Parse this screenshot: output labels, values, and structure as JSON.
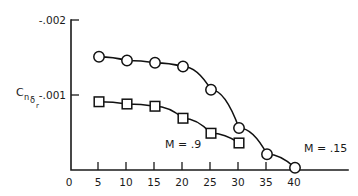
{
  "chart_data": {
    "type": "line",
    "title": "",
    "subtitle": "",
    "xlabel": "",
    "ylabel": "Cnδr",
    "ylabel_base": "C",
    "ylabel_sub1": "n",
    "ylabel_sub2": "δ",
    "ylabel_sub3": "r",
    "x": [
      5,
      10,
      15,
      20,
      25,
      30,
      35,
      40
    ],
    "xlim": [
      0,
      42
    ],
    "ylim": [
      0,
      -0.002
    ],
    "grid": false,
    "legend_position": "inline-annotations",
    "xticks": [
      0,
      5,
      10,
      15,
      20,
      25,
      30,
      35,
      40
    ],
    "xticklabels": [
      "0",
      "5",
      "10",
      "15",
      "20",
      "25",
      "30",
      "35",
      "40"
    ],
    "yticks": [
      0,
      -0.001,
      -0.002
    ],
    "yticklabels": [
      "0",
      "-.001",
      "-.002"
    ],
    "series": [
      {
        "name": "M = .15",
        "marker": "circle",
        "x": [
          5,
          10,
          15,
          20,
          25,
          30,
          35,
          40
        ],
        "values": [
          -0.00151,
          -0.00146,
          -0.00143,
          -0.00138,
          -0.00107,
          -0.00056,
          -0.00021,
          -3e-05
        ]
      },
      {
        "name": "M = .9",
        "marker": "square",
        "x": [
          5,
          10,
          15,
          20,
          25,
          30
        ],
        "values": [
          -0.00091,
          -0.00088,
          -0.00085,
          -0.00069,
          -0.00049,
          -0.00036
        ]
      }
    ],
    "annotations": [
      {
        "text": "M = .9",
        "x": 22.0,
        "y": -0.00042
      },
      {
        "text": "M = .15",
        "x": 39.5,
        "y": -0.00017
      }
    ],
    "colors": {
      "axis": "#1a1a1a",
      "line": "#111111",
      "marker_fill": "#ffffff",
      "background": "#ffffff"
    }
  }
}
